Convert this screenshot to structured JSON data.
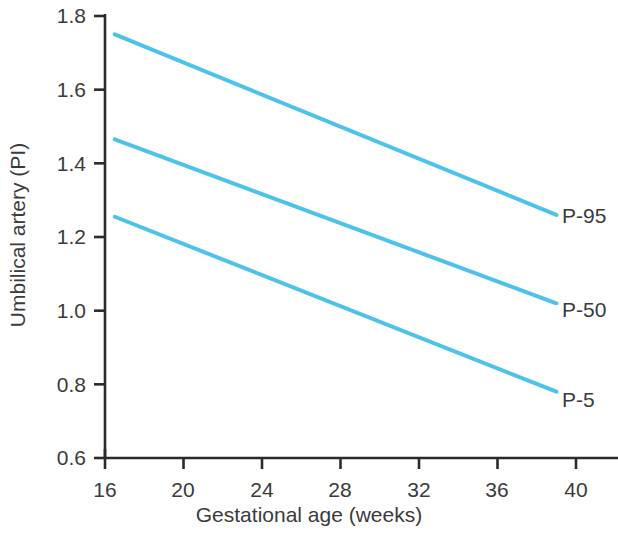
{
  "chart_data": {
    "type": "line",
    "title": "",
    "subtitle": "",
    "xlabel": "Gestational age (weeks)",
    "ylabel": "Umbilical artery (PI)",
    "xlim": [
      16,
      40
    ],
    "ylim": [
      0.6,
      1.8
    ],
    "xticks": [
      16,
      20,
      24,
      28,
      32,
      36,
      40
    ],
    "xtick_labels": [
      "16",
      "20",
      "24",
      "28",
      "32",
      "36",
      "40"
    ],
    "yticks": [
      0.6,
      0.8,
      1.0,
      1.2,
      1.4,
      1.6,
      1.8
    ],
    "ytick_labels": [
      "0.6",
      "0.8",
      "1.0",
      "1.2",
      "1.4",
      "1.6",
      "1.8"
    ],
    "grid": false,
    "legend_position": "right-inline",
    "line_color": "#4ec3ea",
    "axis_color": "#2b2b2b",
    "text_color": "#3b3b3b",
    "line_width": 4,
    "series": [
      {
        "name": "P-95",
        "label": "P-95",
        "color": "#4ec3ea",
        "x": [
          16.5,
          39.0
        ],
        "values": [
          1.75,
          1.26
        ]
      },
      {
        "name": "P-50",
        "label": "P-50",
        "color": "#4ec3ea",
        "x": [
          16.5,
          39.0
        ],
        "values": [
          1.465,
          1.02
        ]
      },
      {
        "name": "P-5",
        "label": "P-5",
        "color": "#4ec3ea",
        "x": [
          16.5,
          39.0
        ],
        "values": [
          1.255,
          0.78
        ]
      }
    ]
  },
  "axis": {
    "ytick_0": "0.6",
    "ytick_1": "0.8",
    "ytick_2": "1.0",
    "ytick_3": "1.2",
    "ytick_4": "1.4",
    "ytick_5": "1.6",
    "ytick_6": "1.8",
    "xtick_0": "16",
    "xtick_1": "20",
    "xtick_2": "24",
    "xtick_3": "28",
    "xtick_4": "32",
    "xtick_5": "36",
    "xtick_6": "40",
    "xlabel": "Gestational age (weeks)",
    "ylabel": "Umbilical artery (PI)"
  },
  "legend": {
    "p95": "P-95",
    "p50": "P-50",
    "p5": "P-5"
  }
}
